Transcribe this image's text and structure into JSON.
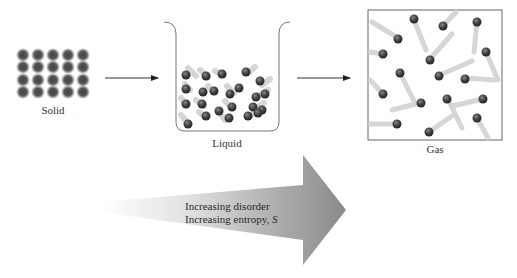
{
  "states": [
    {
      "id": "solid",
      "label": "Solid"
    },
    {
      "id": "liquid",
      "label": "Liquid"
    },
    {
      "id": "gas",
      "label": "Gas"
    }
  ],
  "big_arrow": {
    "line1": "Increasing disorder",
    "line2_prefix": "Increasing entropy, ",
    "line2_symbol": "S"
  },
  "colors": {
    "particle": "#4a4a4a",
    "arrow_gray": "#8c8c8c",
    "outline": "#7a7a7a"
  }
}
